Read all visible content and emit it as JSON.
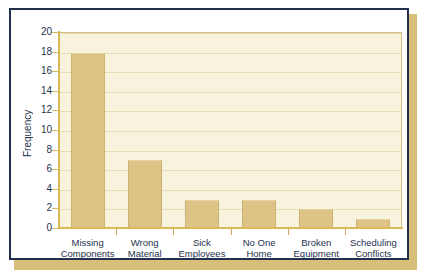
{
  "chart_data": {
    "type": "bar",
    "title": "",
    "xlabel": "",
    "ylabel": "Frequency",
    "categories": [
      "Missing Components",
      "Wrong Material",
      "Sick Employees",
      "No One Home",
      "Broken Equipment",
      "Scheduling Conflicts"
    ],
    "category_lines": [
      [
        "Missing",
        "Components"
      ],
      [
        "Wrong",
        "Material"
      ],
      [
        "Sick",
        "Employees"
      ],
      [
        "No One",
        "Home"
      ],
      [
        "Broken",
        "Equipment"
      ],
      [
        "Scheduling",
        "Conflicts"
      ]
    ],
    "values": [
      18,
      7,
      3,
      3,
      2,
      1
    ],
    "ylim": [
      0,
      20
    ],
    "yticks": [
      0,
      2,
      4,
      6,
      8,
      10,
      12,
      14,
      16,
      18,
      20
    ],
    "ytick_labels": [
      "0",
      "2",
      "4",
      "6",
      "8",
      "10",
      "12",
      "14",
      "16",
      "18",
      "20"
    ],
    "grid": true,
    "legend": "none",
    "colors": {
      "bar_fill": "#ddc486",
      "bar_edge": "#cbb172",
      "plot_background": "#f8f3dc",
      "gridline": "#e8dcb6",
      "axis": "#d9b957",
      "text": "#25324d",
      "frame": "#22304e",
      "shadow": "#c9a84c",
      "card_background": "#ffffff"
    }
  }
}
